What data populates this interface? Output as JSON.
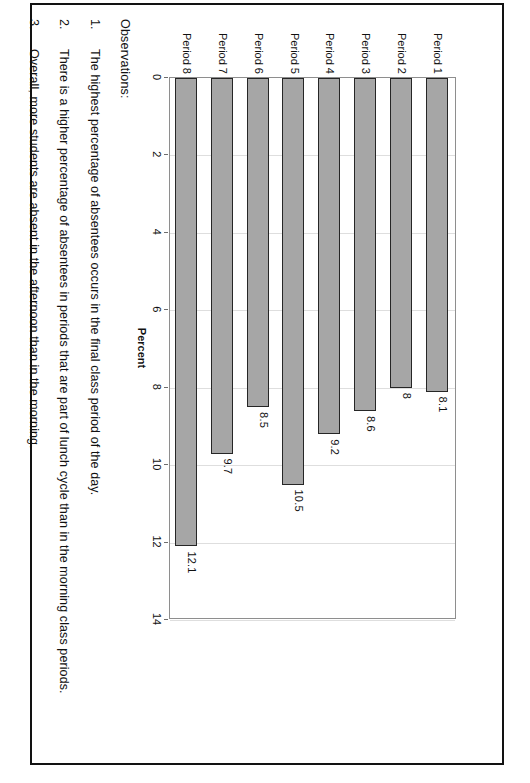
{
  "page": {
    "frame_color": "#121212",
    "background": "#ffffff"
  },
  "chart_data": {
    "type": "bar",
    "orientation": "vertical",
    "title": "",
    "subtitle": "",
    "xlabel": "",
    "ylabel": "Percent",
    "categories": [
      "Period 1",
      "Period 2",
      "Period 3",
      "Period 4",
      "Period 5",
      "Period 6",
      "Period 7",
      "Period 8"
    ],
    "values": [
      8.1,
      8,
      8.6,
      9.2,
      10.5,
      8.5,
      9.7,
      12.1
    ],
    "value_labels": [
      "8.1",
      "8",
      "8.6",
      "9.2",
      "10.5",
      "8.5",
      "9.7",
      "12.1"
    ],
    "ylim": [
      0,
      14
    ],
    "yticks": [
      0,
      2,
      4,
      6,
      8,
      10,
      12,
      14
    ],
    "ytick_labels": [
      "0",
      "2",
      "4",
      "6",
      "8",
      "10",
      "12",
      "14"
    ],
    "grid": true,
    "legend": false,
    "series": [
      {
        "name": "Percent",
        "color": "#a6a6a6",
        "border_color": "#262626",
        "values": [
          8.1,
          8,
          8.6,
          9.2,
          10.5,
          8.5,
          9.7,
          12.1
        ]
      }
    ]
  },
  "observations": {
    "heading": "Observations:",
    "items": [
      {
        "number": "1.",
        "text": "The highest percentage of absentees occurs in the final class period of the day."
      },
      {
        "number": "2.",
        "text": "There is a higher percentage of absentees in periods that are part of lunch cycle than in the morning class periods."
      },
      {
        "number": "3.",
        "text": "Overall, more students are absent in the afternoon than in the morning."
      }
    ]
  }
}
